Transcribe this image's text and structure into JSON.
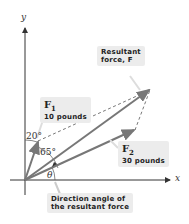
{
  "axes": {
    "x_label": "x",
    "y_label": "y"
  },
  "forces": {
    "f1": {
      "name": "F",
      "subscript": "1",
      "magnitude": "10 pounds"
    },
    "f2": {
      "name": "F",
      "subscript": "2",
      "magnitude": "30 pounds"
    },
    "resultant": {
      "line1": "Resultant",
      "line2": "force, F"
    }
  },
  "angles": {
    "a20": "20°",
    "a65": "65°",
    "theta": "θ"
  },
  "callout": {
    "line1": "Direction angle of",
    "line2": "the resultant force"
  },
  "colors": {
    "vector": "#777777",
    "axis": "#333333",
    "label_bg": "#ececec"
  }
}
